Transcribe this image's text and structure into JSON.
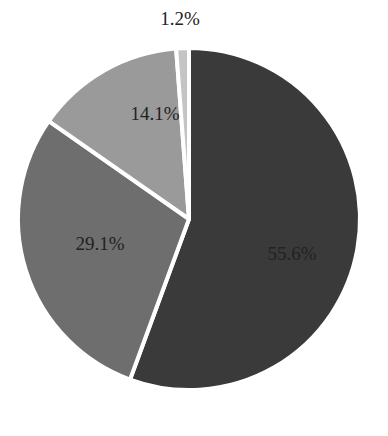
{
  "chart_data": {
    "type": "pie",
    "title": "",
    "categories": [
      "A",
      "B",
      "C",
      "D"
    ],
    "values": [
      55.6,
      29.1,
      14.1,
      1.2
    ],
    "labels": [
      "55.6%",
      "29.1%",
      "14.1%",
      "1.2%"
    ],
    "colors": [
      "#3a3a3a",
      "#6e6e6e",
      "#9a9a9a",
      "#c4c4c4"
    ],
    "start_angle_deg": 0,
    "direction": "clockwise",
    "legend": "none"
  }
}
